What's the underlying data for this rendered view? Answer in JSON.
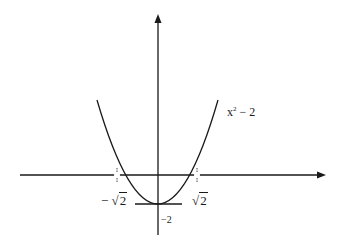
{
  "diagram": {
    "type": "function-graph",
    "function_label": {
      "base": "x",
      "exponent": "2",
      "rest": " − 2"
    },
    "root_left": {
      "sign": "−",
      "radical": "√",
      "value": "2"
    },
    "root_right": {
      "radical": "√",
      "value": "2"
    },
    "vertex_label": "−2",
    "colors": {
      "stroke": "#1a1a1a",
      "background": "#ffffff"
    }
  }
}
